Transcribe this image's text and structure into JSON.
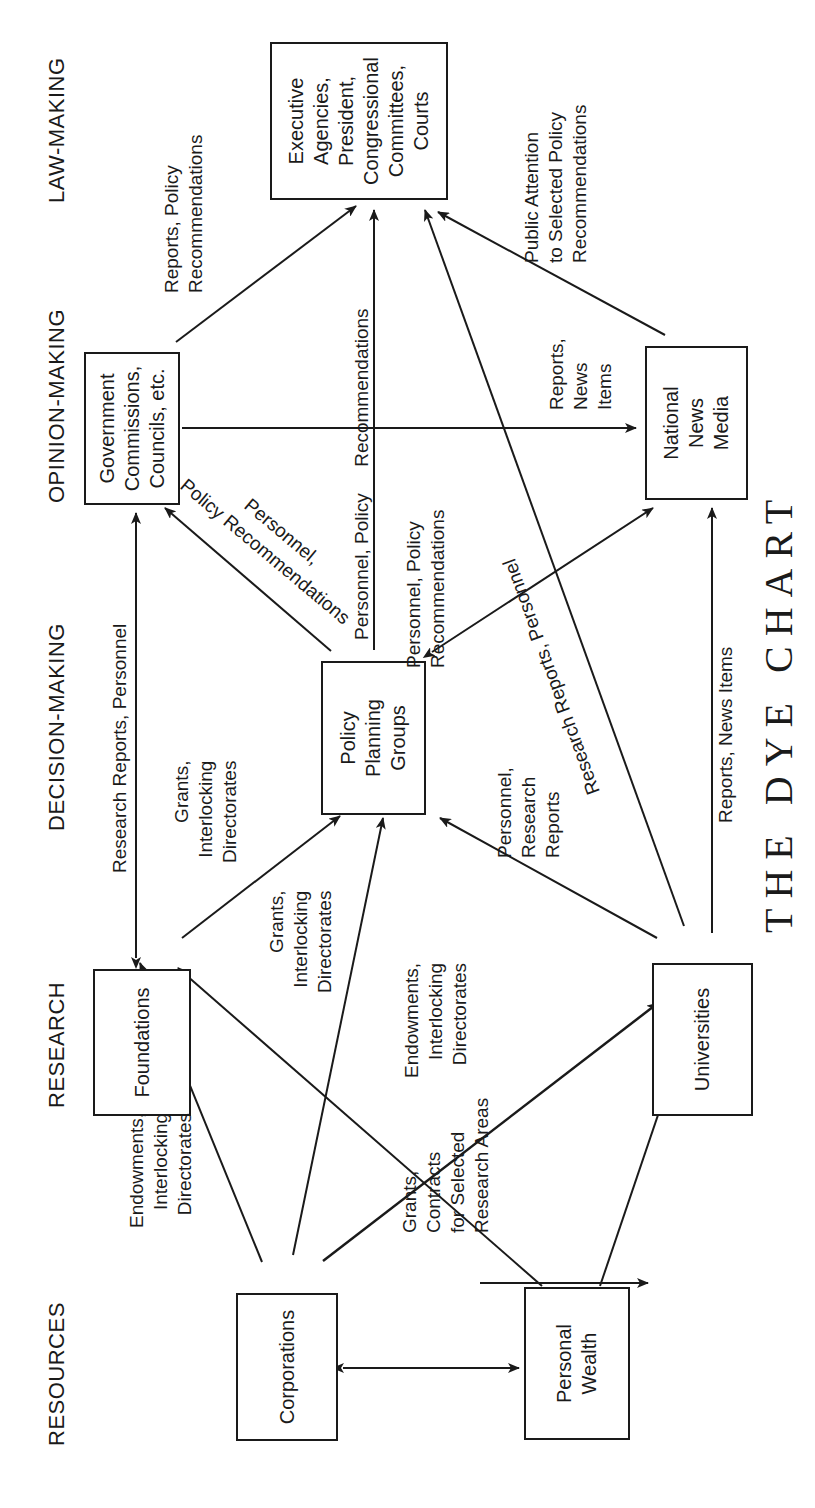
{
  "title": "THE DYE CHART",
  "stages": {
    "resources": "RESOURCES",
    "research": "RESEARCH",
    "decision_making": "DECISION-MAKING",
    "opinion_making": "OPINION-MAKING",
    "law_making": "LAW-MAKING"
  },
  "nodes": {
    "corporations": "Corporations",
    "personal_wealth": "Personal\nWealth",
    "foundations": "Foundations",
    "universities": "Universities",
    "policy_planning": "Policy\nPlanning\nGroups",
    "gov_commissions": "Government\nCommissions,\nCouncils, etc.",
    "news_media": "National\nNews\nMedia",
    "executive": "Executive\nAgencies,\nPresident,\nCongressional\nCommittees,\nCourts"
  },
  "edges": {
    "corp_to_foundations": "Endowments,\nInterlocking\nDirectorates",
    "corp_wealth_to_universities": "Endowments,\nInterlocking\nDirectorates",
    "foundations_to_policy": "Grants,\nInterlocking\nDirectorates",
    "corp_to_policy": "Grants,\nInterlocking\nDirectorates",
    "foundations_to_universities": "Grants,\nContracts\nfor Selected\nResearch Areas",
    "universities_to_policy": "Personnel,\nResearch\nReports",
    "universities_to_executive": "Research Reports, Personnel",
    "universities_to_news": "Reports, News Items",
    "foundations_gov_link": "Research Reports, Personnel",
    "policy_to_gov": "Personnel,\nPolicy Recommendations",
    "policy_to_executive": "Personnel, Policy     Recommendations",
    "policy_news_link": "Personnel, Policy\nRecommendations",
    "gov_to_news": "Reports,\nNews\nItems",
    "gov_to_executive": "Reports, Policy\nRecommendations",
    "news_to_executive": "Public Attention\nto Selected Policy\nRecommendations"
  },
  "colors": {
    "ink": "#1a1a1a",
    "background": "#ffffff"
  }
}
